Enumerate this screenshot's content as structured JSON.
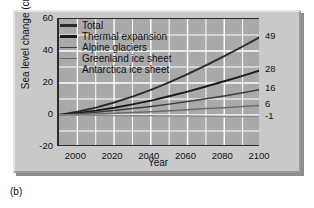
{
  "caption": "(b)",
  "chart_data": {
    "type": "line",
    "title": "",
    "xlabel": "Year",
    "ylabel": "Sea level change (cm)",
    "xlim": [
      1990,
      2100
    ],
    "ylim": [
      -20,
      60
    ],
    "xticks": [
      2000,
      2020,
      2040,
      2060,
      2080,
      2100
    ],
    "yticks": [
      -20,
      0,
      20,
      40,
      60
    ],
    "grid": true,
    "grid_color": "#ffffff",
    "plot_background": "#a9a9a9",
    "legend_position": "top-left",
    "x": [
      1990,
      2000,
      2010,
      2020,
      2030,
      2040,
      2050,
      2060,
      2070,
      2080,
      2090,
      2100
    ],
    "series": [
      {
        "name": "Total",
        "color": "#2b2b2b",
        "end_label": "49",
        "values": [
          0,
          2.0,
          4.6,
          7.8,
          11.5,
          15.7,
          20.4,
          25.5,
          31.0,
          36.8,
          42.8,
          49
        ]
      },
      {
        "name": "Thermal expansion",
        "color": "#1a1a1a",
        "end_label": "28",
        "values": [
          0,
          1.2,
          2.7,
          4.5,
          6.6,
          9.0,
          11.7,
          14.6,
          17.8,
          21.1,
          24.5,
          28
        ]
      },
      {
        "name": "Alpine glaciers",
        "color": "#3d3d3d",
        "end_label": "16",
        "values": [
          0,
          0.8,
          1.7,
          2.8,
          4.0,
          5.3,
          6.8,
          8.4,
          10.1,
          11.9,
          13.9,
          16
        ]
      },
      {
        "name": "Greenland ice sheet",
        "color": "#6b6b6b",
        "end_label": "6",
        "values": [
          0,
          0.3,
          0.7,
          1.1,
          1.6,
          2.1,
          2.7,
          3.3,
          4.0,
          4.6,
          5.3,
          6
        ]
      },
      {
        "name": "Antarctica ice sheet",
        "color": "#8a8a8a",
        "end_label": "-1",
        "values": [
          0,
          -0.1,
          -0.2,
          -0.3,
          -0.4,
          -0.5,
          -0.6,
          -0.7,
          -0.8,
          -0.9,
          -0.95,
          -1
        ]
      }
    ]
  }
}
